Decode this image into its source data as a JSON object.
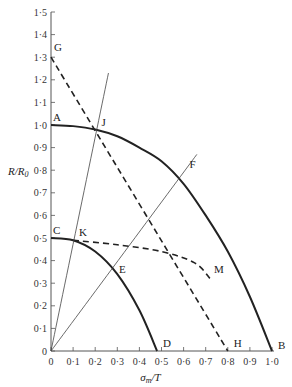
{
  "chart_data": {
    "type": "line",
    "title": "",
    "xlabel": "σm/T",
    "ylabel": "R/R0",
    "xlim": [
      0,
      1.0
    ],
    "ylim": [
      0,
      1.5
    ],
    "x_ticks": [
      "0",
      "0·1",
      "0·2",
      "0·3",
      "0·4",
      "0·5",
      "0·6",
      "0·7",
      "0·8",
      "0·9",
      "1·0"
    ],
    "y_ticks": [
      "0",
      "0·1",
      "0·2",
      "0·3",
      "0·4",
      "0·5",
      "0·6",
      "0·7",
      "0·8",
      "0·9",
      "1·0",
      "1·1",
      "1·2",
      "1·3",
      "1·4",
      "1·5"
    ],
    "grid": false,
    "series": [
      {
        "name": "curve A-B",
        "style": "solid-thick",
        "x": [
          0,
          0.1,
          0.2,
          0.3,
          0.4,
          0.5,
          0.6,
          0.7,
          0.8,
          0.9,
          1.0
        ],
        "y": [
          1.0,
          0.995,
          0.98,
          0.95,
          0.9,
          0.84,
          0.74,
          0.6,
          0.44,
          0.24,
          0
        ]
      },
      {
        "name": "curve C-D",
        "style": "solid-thick",
        "x": [
          0,
          0.1,
          0.2,
          0.3,
          0.4,
          0.48
        ],
        "y": [
          0.5,
          0.49,
          0.44,
          0.34,
          0.18,
          0
        ]
      },
      {
        "name": "line G-H",
        "style": "dashed",
        "x": [
          0,
          0.8
        ],
        "y": [
          1.3,
          0
        ]
      },
      {
        "name": "curve K-M",
        "style": "dashed",
        "x": [
          0.1,
          0.3,
          0.5,
          0.65,
          0.72
        ],
        "y": [
          0.49,
          0.47,
          0.44,
          0.39,
          0.32
        ]
      },
      {
        "name": "line O-J",
        "style": "solid-thin",
        "x": [
          0,
          0.26
        ],
        "y": [
          0,
          1.23
        ]
      },
      {
        "name": "line O-F",
        "style": "solid-thin",
        "x": [
          0,
          0.66
        ],
        "y": [
          0,
          0.87
        ]
      }
    ],
    "annotations": [
      {
        "label": "A",
        "x": 0.0,
        "y": 1.0
      },
      {
        "label": "B",
        "x": 1.0,
        "y": 0.0
      },
      {
        "label": "C",
        "x": 0.0,
        "y": 0.5
      },
      {
        "label": "D",
        "x": 0.48,
        "y": 0.0
      },
      {
        "label": "E",
        "x": 0.28,
        "y": 0.37
      },
      {
        "label": "F",
        "x": 0.6,
        "y": 0.79
      },
      {
        "label": "G",
        "x": 0.0,
        "y": 1.3
      },
      {
        "label": "H",
        "x": 0.8,
        "y": 0.0
      },
      {
        "label": "J",
        "x": 0.21,
        "y": 0.98
      },
      {
        "label": "K",
        "x": 0.1,
        "y": 0.49
      },
      {
        "label": "M",
        "x": 0.72,
        "y": 0.32
      }
    ]
  },
  "axes": {
    "xlabel_main": "σ",
    "xlabel_sub": "m",
    "xlabel_rest": "/T",
    "ylabel_main": "R/R",
    "ylabel_sub": "0"
  }
}
